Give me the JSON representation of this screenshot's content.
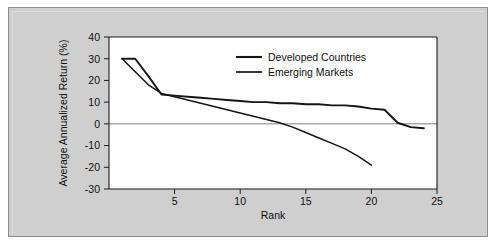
{
  "figure": {
    "background_color": "#cfcfcf",
    "plot_background_color": "#ffffff",
    "border_color": "#8d8d8d"
  },
  "chart_data": {
    "type": "line",
    "title": "",
    "xlabel": "Rank",
    "ylabel": "Average Annualized Return (%)",
    "xlim": [
      0,
      25
    ],
    "ylim": [
      -30,
      40
    ],
    "xticks": [
      5,
      10,
      15,
      20,
      25
    ],
    "xtick_labels": [
      "5",
      "10",
      "15",
      "20",
      "25"
    ],
    "yticks": [
      -30,
      -20,
      -10,
      0,
      10,
      20,
      30,
      40
    ],
    "ytick_labels": [
      "-30",
      "-20",
      "-10",
      "0",
      "10",
      "20",
      "30",
      "40"
    ],
    "grid": false,
    "zero_line": true,
    "legend_position": "upper center",
    "line_color": "#151515",
    "series": [
      {
        "name": "Developed Countries",
        "x": [
          1,
          2,
          3,
          4,
          5,
          6,
          7,
          8,
          9,
          10,
          11,
          12,
          13,
          14,
          15,
          16,
          17,
          18,
          19,
          20,
          21,
          22,
          23,
          24
        ],
        "values": [
          30,
          30,
          22,
          13.5,
          13,
          12.5,
          12,
          11.5,
          11,
          10.5,
          10,
          10,
          9.5,
          9.5,
          9,
          9,
          8.5,
          8.5,
          8,
          7,
          6.5,
          0.5,
          -1.5,
          -2
        ]
      },
      {
        "name": "Emerging Markets",
        "x": [
          1,
          2,
          3,
          4,
          5,
          6,
          7,
          8,
          9,
          10,
          11,
          12,
          13,
          14,
          15,
          16,
          17,
          18,
          19,
          20
        ],
        "values": [
          30,
          24,
          18,
          14,
          12.5,
          11,
          9.5,
          8,
          6.5,
          5,
          3.5,
          2,
          0.5,
          -1.5,
          -4,
          -6.5,
          -9,
          -11.5,
          -15,
          -19
        ]
      }
    ]
  },
  "legend": {
    "items": [
      {
        "label": "Developed Countries"
      },
      {
        "label": "Emerging Markets"
      }
    ]
  }
}
